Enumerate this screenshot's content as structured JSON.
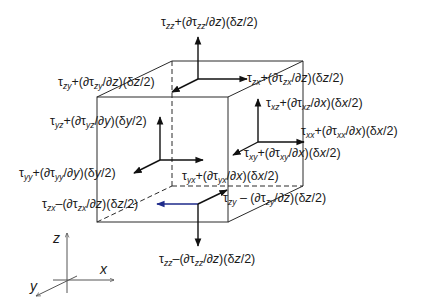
{
  "diagram": {
    "colors": {
      "line": "#2a2a2a",
      "arrow": "#111111",
      "highlight_arrow": "#1e2a8a",
      "text": "#1a1a1a",
      "background": "#ffffff"
    },
    "cube": {
      "front_face": {
        "x1": 97,
        "y1": 97,
        "x2": 228,
        "y2": 222
      },
      "back_offset": {
        "dx": 75,
        "dy": -36
      },
      "hidden_edges": "dashed"
    },
    "labels": {
      "tau_zz_top": {
        "sym": "τ",
        "sub": "zz",
        "sign": "+",
        "var": "z",
        "half": "z",
        "text": "τzz+(∂τzz/∂z)(δz/2)"
      },
      "tau_zy_top": {
        "sym": "τ",
        "sub": "zy",
        "sign": "+",
        "var": "z",
        "half": "z",
        "text": "τzy+(∂τzy/∂z)(δz/2)"
      },
      "tau_zx_top": {
        "sym": "τ",
        "sub": "zx",
        "sign": "+",
        "var": "z",
        "half": "z",
        "text": "τzx+(∂τzx/∂z)(δz/2)"
      },
      "tau_yz_front": {
        "sym": "τ",
        "sub": "yz",
        "sign": "+",
        "var": "y",
        "half": "y",
        "text": "τyz+(∂τyz/∂y)(δy/2)"
      },
      "tau_xz_right": {
        "sym": "τ",
        "sub": "xz",
        "sign": "+",
        "var": "x",
        "half": "x",
        "text": "τxz+(∂τxz/∂x)(δx/2)"
      },
      "tau_xx_right": {
        "sym": "τ",
        "sub": "xx",
        "sign": "+",
        "var": "x",
        "half": "x",
        "text": "τxx+(∂τxx/∂x)(δx/2)"
      },
      "tau_xy_right": {
        "sym": "τ",
        "sub": "xy",
        "sign": "+",
        "var": "x",
        "half": "x",
        "text": "τxy+(∂τxy/∂x)(δx/2)"
      },
      "tau_yy_front": {
        "sym": "τ",
        "sub": "yy",
        "sign": "+",
        "var": "y",
        "half": "y",
        "text": "τyy+(∂τyy/∂y)(δy/2)"
      },
      "tau_yx_front": {
        "sym": "τ",
        "sub": "yx",
        "sign": "+",
        "var": "x",
        "half": "x",
        "text": "τyx+(∂τyx/∂x)(δx/2)"
      },
      "tau_zx_bottom": {
        "sym": "τ",
        "sub": "zx",
        "sign": "–",
        "var": "z",
        "half": "z",
        "text": "τzx–(∂τzx/∂z)(δz/2)"
      },
      "tau_zy_bottom": {
        "sym": "τ",
        "sub": "zy",
        "sign": " – ",
        "var": "z",
        "half": "z",
        "text": "τzy – (∂τzy/∂z)(δz/2)"
      },
      "tau_zz_bottom": {
        "sym": "τ",
        "sub": "zz",
        "sign": "–",
        "var": "z",
        "half": "z",
        "text": "τzz–(∂τzz/∂z)(δz/2)"
      }
    },
    "axes": {
      "z": "z",
      "x": "x",
      "y": "y"
    }
  }
}
